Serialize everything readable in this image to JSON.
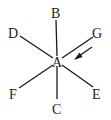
{
  "diagram": {
    "center": {
      "label": "A"
    },
    "nodes": [
      {
        "id": "B",
        "label": "B"
      },
      {
        "id": "C",
        "label": "C"
      },
      {
        "id": "D",
        "label": "D"
      },
      {
        "id": "E",
        "label": "E"
      },
      {
        "id": "F",
        "label": "F"
      },
      {
        "id": "G",
        "label": "G"
      }
    ],
    "arrow": {
      "from": "G",
      "to": "A",
      "description": "arrow pointing toward A along line AG"
    },
    "colors": {
      "line": "#1a1a1a",
      "background": "#ffffff"
    }
  }
}
